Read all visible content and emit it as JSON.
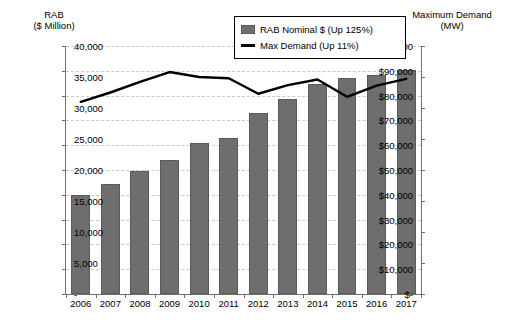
{
  "chart_data": {
    "type": "bar",
    "title": "",
    "categories": [
      "2006",
      "2007",
      "2008",
      "2009",
      "2010",
      "2011",
      "2012",
      "2013",
      "2014",
      "2015",
      "2016",
      "2017"
    ],
    "series": [
      {
        "name": "RAB Nominal $ (Up 125%)",
        "type": "bar",
        "axis": "left",
        "color": "#6e6e6e",
        "values": [
          40000,
          44500,
          49500,
          54000,
          61000,
          63000,
          73000,
          78500,
          84500,
          87000,
          88500,
          90500
        ]
      },
      {
        "name": "Max Demand (Up 11%)",
        "type": "line",
        "axis": "right",
        "color": "#000000",
        "values": [
          31000,
          32500,
          34200,
          35800,
          35000,
          34800,
          32300,
          33700,
          34600,
          31800,
          33600,
          34700
        ]
      }
    ],
    "xlabel": "",
    "left_axis": {
      "label_line1": "RAB",
      "label_line2": "($ Million)",
      "ylim": [
        0,
        100000
      ],
      "tick_step": 10000,
      "ticks": [
        "$-",
        "$10,000",
        "$20,000",
        "$30,000",
        "$40,000",
        "$50,000",
        "$60,000",
        "$70,000",
        "$80,000",
        "$90,000",
        "$100,000"
      ]
    },
    "right_axis": {
      "label_line1": "Maximum Demand",
      "label_line2": "(MW)",
      "ylim": [
        0,
        40000
      ],
      "tick_step": 5000,
      "ticks": [
        "-",
        "5,000",
        "10,000",
        "15,000",
        "20,000",
        "25,000",
        "30,000",
        "35,000",
        "40,000"
      ]
    },
    "grid": true,
    "legend_position": "top-center"
  },
  "legend": {
    "bar_label": "RAB Nominal $ (Up 125%)",
    "line_label": "Max Demand (Up 11%)"
  }
}
